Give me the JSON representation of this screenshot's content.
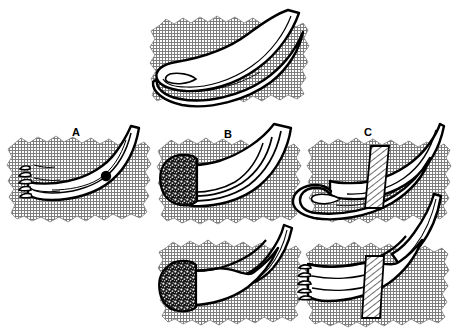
{
  "figure": {
    "title": "",
    "domain_type": "anatomical-line-diagram",
    "canvas": {
      "width": 454,
      "height": 334
    },
    "colors": {
      "ink": "#000000",
      "paper": "#ffffff",
      "tissue_hatch_line": "#8a8a8a",
      "tissue_fill": "#c9c9c9",
      "stipple_dark": "#1a1a1a",
      "band_hatch": "#000000",
      "marker_dot": "#000000"
    },
    "labels": [
      {
        "id": "label-a",
        "text": "A",
        "x": 76,
        "y": 133
      },
      {
        "id": "label-b",
        "text": "B",
        "x": 228,
        "y": 135
      },
      {
        "id": "label-c",
        "text": "C",
        "x": 368,
        "y": 133
      }
    ],
    "panels": [
      {
        "id": "panel-top",
        "label": "",
        "position": "top-center",
        "bounds": {
          "x": 150,
          "y": 8,
          "width": 160,
          "height": 112
        },
        "description": "Intact curved tubular structure folded back into a loop on a hatched tissue patch",
        "features": [
          "curved-tube",
          "folded-loop",
          "tissue-patch"
        ]
      },
      {
        "id": "panel-a",
        "label": "A",
        "position": "middle-left",
        "bounds": {
          "x": 2,
          "y": 128,
          "width": 150,
          "height": 100
        },
        "description": "Curved tubular structure with frayed torn fibers at the left end and a solid black round marker on the body",
        "features": [
          "curved-tube",
          "frayed-end",
          "black-dot-marker",
          "tissue-patch"
        ]
      },
      {
        "id": "panel-b-upper",
        "label": "B",
        "position": "middle-center",
        "bounds": {
          "x": 152,
          "y": 128,
          "width": 152,
          "height": 100
        },
        "description": "Curved tubular structure with a dark stippled bulbous rounded end at the left and multiple longitudinal strands",
        "features": [
          "curved-tube",
          "stippled-bulb-end",
          "longitudinal-strands",
          "tissue-patch"
        ]
      },
      {
        "id": "panel-c-upper",
        "label": "C",
        "position": "middle-right",
        "bounds": {
          "x": 304,
          "y": 128,
          "width": 150,
          "height": 100
        },
        "description": "Looped tubular structure crossed by a vertical diagonally hatched band or strap",
        "features": [
          "curved-tube",
          "folded-loop",
          "hatched-band",
          "tissue-patch"
        ]
      },
      {
        "id": "panel-b-lower",
        "label": "B",
        "position": "bottom-center",
        "bounds": {
          "x": 152,
          "y": 226,
          "width": 152,
          "height": 104
        },
        "description": "Thickened tubular body with dark stippled bulbous end at left and a separated free segment above right",
        "features": [
          "thick-tube",
          "stippled-bulb-end",
          "detached-segment",
          "tissue-patch"
        ]
      },
      {
        "id": "panel-c-lower",
        "label": "C",
        "position": "bottom-right",
        "bounds": {
          "x": 304,
          "y": 226,
          "width": 150,
          "height": 104
        },
        "description": "Tubular body with frayed torn fibers at left crossed by a vertical diagonally hatched band",
        "features": [
          "thick-tube",
          "frayed-end",
          "hatched-band",
          "detached-segment",
          "tissue-patch"
        ]
      }
    ],
    "annotations": {
      "marker_dot": {
        "id": "marker-dot-a",
        "cx": 106,
        "cy": 176,
        "r": 5.2,
        "panel": "panel-a"
      }
    }
  }
}
